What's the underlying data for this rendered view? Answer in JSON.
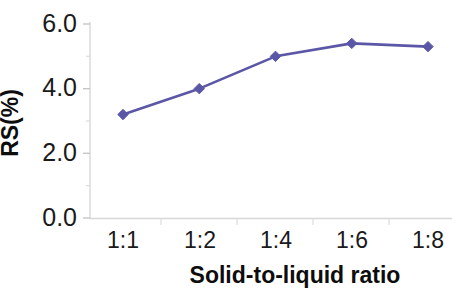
{
  "chart_data": {
    "type": "line",
    "title": "",
    "xlabel": "Solid-to-liquid ratio",
    "ylabel": "RS(%)",
    "categories": [
      "1:1",
      "1:2",
      "1:4",
      "1:6",
      "1:8"
    ],
    "values": [
      3.2,
      4.0,
      5.0,
      5.4,
      5.3
    ],
    "series": [
      {
        "name": "RS",
        "values": [
          3.2,
          4.0,
          5.0,
          5.4,
          5.3
        ],
        "color": "#5B57A6",
        "marker": "diamond"
      }
    ],
    "ylim": [
      0.0,
      6.0
    ],
    "ytick_labels": [
      "0.0",
      "2.0",
      "4.0",
      "6.0"
    ],
    "ytick_values": [
      0.0,
      2.0,
      4.0,
      6.0
    ],
    "yminor_values": [
      1.0,
      3.0,
      5.0
    ],
    "xtick_labels": [
      "1:1",
      "1:2",
      "1:4",
      "1:6",
      "1:8"
    ],
    "grid": false,
    "legend": false,
    "legend_position": "none",
    "line_color": "#5B57A6",
    "axis_color": "#d8d8d8",
    "background": "#ffffff"
  },
  "axis": {
    "y_labels": [
      {
        "text": "6.0",
        "value": 6.0
      },
      {
        "text": "4.0",
        "value": 4.0
      },
      {
        "text": "2.0",
        "value": 2.0
      },
      {
        "text": "0.0",
        "value": 0.0
      }
    ],
    "x_labels": [
      {
        "text": "1:1"
      },
      {
        "text": "1:2"
      },
      {
        "text": "1:4"
      },
      {
        "text": "1:6"
      },
      {
        "text": "1:8"
      }
    ],
    "y_title": "RS(%)",
    "x_title": "Solid-to-liquid ratio"
  }
}
